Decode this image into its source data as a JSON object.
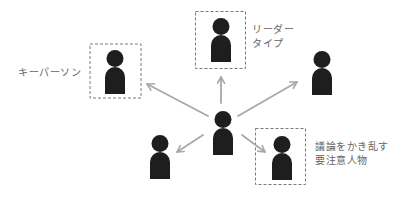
{
  "diagram": {
    "colors": {
      "figure": "#1e1e1e",
      "arrow": "#a8a8a8",
      "box_border": "#7a7a7a",
      "label_text": "#666666",
      "background": "#ffffff"
    },
    "center_person": {
      "role": "speaker"
    },
    "people": [
      {
        "id": "key-person",
        "highlighted": true,
        "label_lines": [
          "キーパーソン"
        ]
      },
      {
        "id": "leader-type",
        "highlighted": true,
        "label_lines": [
          "リーダー",
          "タイプ"
        ]
      },
      {
        "id": "right-person",
        "highlighted": false,
        "label_lines": []
      },
      {
        "id": "lower-left-person",
        "highlighted": false,
        "label_lines": []
      },
      {
        "id": "disruptor",
        "highlighted": true,
        "label_lines": [
          "議論をかき乱す",
          "要注意人物"
        ]
      }
    ]
  }
}
